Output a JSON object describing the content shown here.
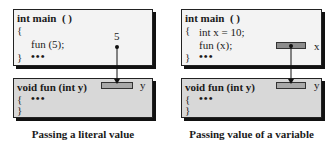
{
  "left_panel": {
    "caller": {
      "signature": "int main  ( )",
      "open_brace": "{",
      "call": "fun (5);",
      "close_brace": "}",
      "ellipsis": "•••"
    },
    "literal_value": "5",
    "callee": {
      "signature": "void fun (int y)",
      "open_brace": "{",
      "ellipsis": "•••",
      "close_brace": "}",
      "param_label": "y"
    },
    "caption": "Passing a literal value"
  },
  "right_panel": {
    "caller": {
      "signature": "int main  ( )",
      "open_brace": "{",
      "declaration": "int x = 10;",
      "call": "fun (x);",
      "close_brace": "}",
      "ellipsis": "•••",
      "var_label": "x"
    },
    "callee": {
      "signature": "void fun (int y)",
      "open_brace": "{",
      "ellipsis": "•••",
      "close_brace": "}",
      "param_label": "y"
    },
    "caption": "Passing value of a variable"
  },
  "colors": {
    "caller_box_fill": "#f3f3f3",
    "callee_box_fill": "#d8d8d8",
    "param_box_fill": "#a8a8a8",
    "var_box_fill": "#8c8c8c",
    "line": "#111111"
  }
}
